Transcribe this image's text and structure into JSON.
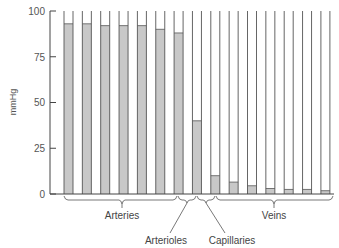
{
  "chart_data": {
    "type": "bar",
    "title": "",
    "xlabel": "",
    "ylabel": "mmHg",
    "ylim": [
      0,
      100
    ],
    "yticks": [
      0,
      25,
      50,
      75,
      100
    ],
    "grid": false,
    "categories": [
      "1",
      "2",
      "3",
      "4",
      "5",
      "6",
      "7",
      "8",
      "9",
      "10",
      "11",
      "12",
      "13",
      "14",
      "15"
    ],
    "values": [
      93,
      93,
      92,
      92,
      92,
      90,
      88,
      40,
      10,
      6.5,
      4.5,
      3,
      2.5,
      2.5,
      1.8
    ],
    "groups": [
      {
        "label": "Arteries",
        "bars": [
          0,
          1,
          2,
          3,
          4,
          5
        ]
      },
      {
        "label": "Arterioles",
        "bars": [
          6
        ]
      },
      {
        "label": "Capillaries",
        "bars": [
          7
        ]
      },
      {
        "label": "Veins",
        "bars": [
          8,
          9,
          10,
          11,
          12,
          13,
          14
        ]
      }
    ],
    "colors": {
      "fill": "#c8c8c8",
      "outline": "#555555",
      "axis": "#444444"
    }
  },
  "labels": {
    "ylabel": "mmHg",
    "y100": "100",
    "y75": "75",
    "y50": "50",
    "y25": "25",
    "y0": "0",
    "arteries": "Arteries",
    "arterioles": "Arterioles",
    "capillaries": "Capillaries",
    "veins": "Veins"
  }
}
